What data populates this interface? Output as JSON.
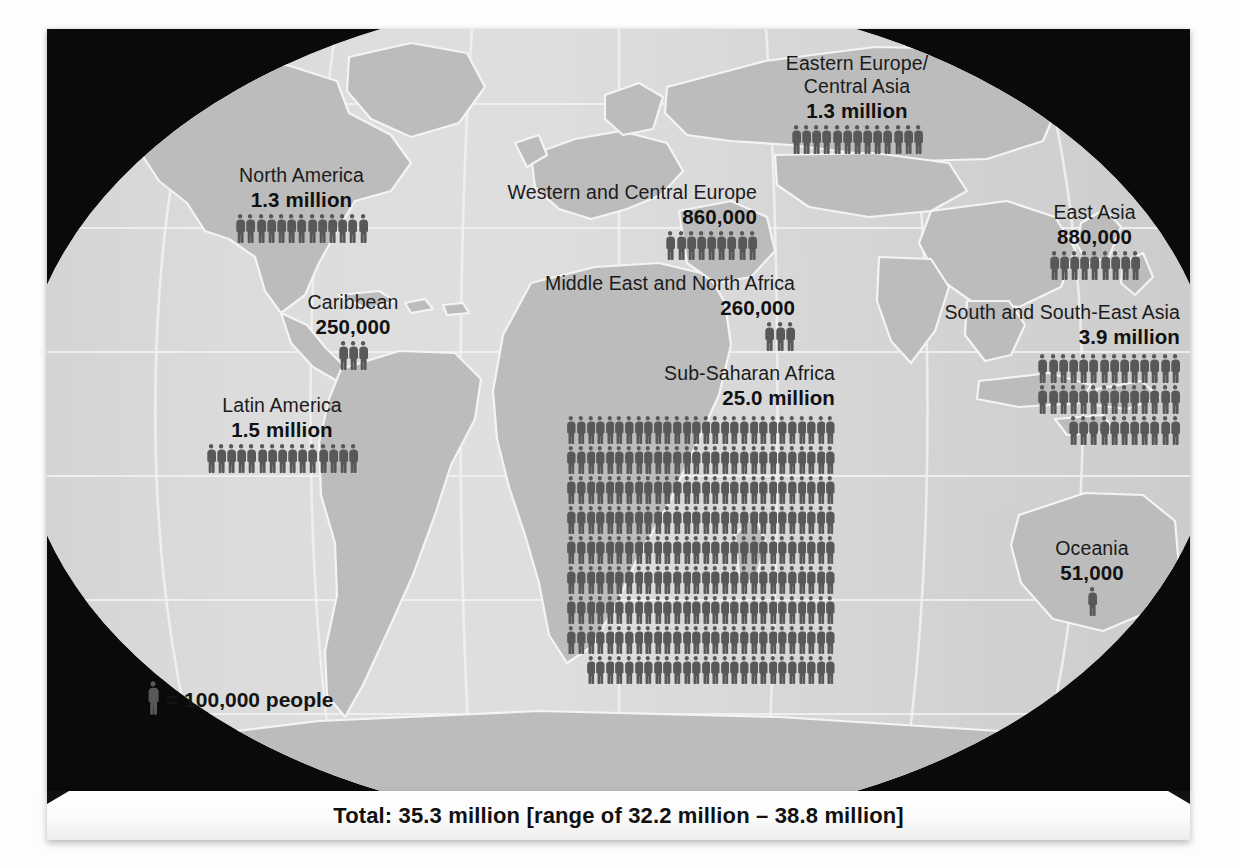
{
  "legend": {
    "icon": "person-icon",
    "text": "= 100,000 people",
    "unit_value": 100000
  },
  "footer": {
    "total_text": "Total: 35.3 million [range of 32.2 million – 38.8 million]"
  },
  "colors": {
    "background": "#0a0a0a",
    "ocean": "#d9d9d9",
    "land": "#b9b9b9",
    "graticule": "#f2f2f2",
    "figure": "#58585a",
    "text": "#1b1b1b"
  },
  "chart_data": {
    "type": "pictogram",
    "unit": "1 figure = 100,000 people",
    "total": "35.3 million",
    "total_range_low": "32.2 million",
    "total_range_high": "38.8 million",
    "categories": [
      "North America",
      "Caribbean",
      "Latin America",
      "Western and Central Europe",
      "Eastern Europe/Central Asia",
      "Middle East and North Africa",
      "Sub-Saharan Africa",
      "East Asia",
      "South and South-East Asia",
      "Oceania"
    ],
    "values": [
      1300000,
      250000,
      1500000,
      860000,
      1300000,
      260000,
      25000000,
      880000,
      3900000,
      51000
    ],
    "value_labels": [
      "1.3 million",
      "250,000",
      "1.5 million",
      "860,000",
      "1.3 million",
      "260,000",
      "25.0 million",
      "880,000",
      "3.9 million",
      "51,000"
    ]
  },
  "regions": [
    {
      "id": "north-america",
      "name": "North America",
      "value": "1.3 million",
      "align": "center",
      "figures": 13,
      "per_row": 13,
      "rows": [
        13
      ],
      "fig_w": 10.2,
      "fig_h": 31
    },
    {
      "id": "caribbean",
      "name": "Caribbean",
      "value": "250,000",
      "align": "center",
      "figures": 3,
      "per_row": 3,
      "rows": [
        3
      ],
      "fig_w": 10.2,
      "fig_h": 31
    },
    {
      "id": "latin-america",
      "name": "Latin America",
      "value": "1.5 million",
      "align": "center",
      "figures": 15,
      "per_row": 15,
      "rows": [
        15
      ],
      "fig_w": 10.2,
      "fig_h": 31
    },
    {
      "id": "western-central-europe",
      "name": "Western and Central Europe",
      "value": "860,000",
      "align": "right",
      "figures": 9,
      "per_row": 9,
      "rows": [
        9
      ],
      "fig_w": 10.2,
      "fig_h": 31
    },
    {
      "id": "eastern-europe-central-asia",
      "name": "Eastern Europe/\nCentral Asia",
      "name_line1": "Eastern Europe/",
      "name_line2": "Central Asia",
      "value": "1.3 million",
      "align": "center",
      "figures": 13,
      "per_row": 13,
      "rows": [
        13
      ],
      "fig_w": 10.2,
      "fig_h": 31
    },
    {
      "id": "middle-east-north-africa",
      "name": "Middle East and North Africa",
      "value": "260,000",
      "align": "right",
      "figures": 3,
      "per_row": 3,
      "rows": [
        3
      ],
      "fig_w": 10.2,
      "fig_h": 31
    },
    {
      "id": "sub-saharan-africa",
      "name": "Sub-Saharan Africa",
      "value": "25.0 million",
      "align": "right",
      "figures": 250,
      "per_row": 28,
      "rows": [
        28,
        28,
        28,
        28,
        28,
        28,
        28,
        28,
        26
      ],
      "fig_w": 9.6,
      "fig_h": 30
    },
    {
      "id": "east-asia",
      "name": "East Asia",
      "value": "880,000",
      "align": "center",
      "figures": 9,
      "per_row": 9,
      "rows": [
        9
      ],
      "fig_w": 10.2,
      "fig_h": 31
    },
    {
      "id": "south-south-east-asia",
      "name": "South and South-East Asia",
      "value": "3.9 million",
      "align": "right",
      "figures": 39,
      "per_row": 14,
      "rows": [
        14,
        14,
        11
      ],
      "fig_w": 10.2,
      "fig_h": 31
    },
    {
      "id": "oceania",
      "name": "Oceania",
      "value": "51,000",
      "align": "center",
      "figures": 1,
      "per_row": 1,
      "rows": [
        1
      ],
      "fig_w": 10.2,
      "fig_h": 31
    }
  ]
}
